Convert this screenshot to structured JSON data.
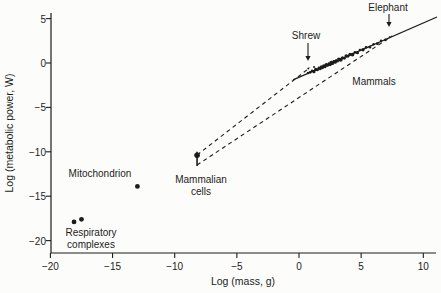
{
  "figure": {
    "background": "#fcfcfa",
    "ink_color": "#1c1c1c"
  },
  "chart_data": {
    "type": "scatter",
    "title": "",
    "xlabel": "Log (mass, g)",
    "ylabel": "Log (metabolic power, W)",
    "xlim": [
      -20,
      10
    ],
    "ylim": [
      -20,
      5
    ],
    "x_ticks": [
      -20,
      -15,
      -10,
      -5,
      0,
      5,
      10
    ],
    "y_ticks": [
      5,
      0,
      -5,
      -10,
      -15,
      -20
    ],
    "grid": false,
    "legend": "none",
    "series": [
      {
        "name": "Respiratory complexes",
        "marker_r": 2.4,
        "points": [
          [
            -18.1,
            -17.9
          ],
          [
            -17.5,
            -17.6
          ]
        ]
      },
      {
        "name": "Mitochondrion",
        "marker_r": 2.4,
        "points": [
          [
            -13.0,
            -13.9
          ]
        ]
      },
      {
        "name": "Mammalian cells",
        "marker_r": 2.8,
        "points": [
          [
            -8.2,
            -10.4
          ]
        ],
        "error_bar_y": [
          -11.6,
          -10.0
        ]
      },
      {
        "name": "Mammals",
        "marker_r": 1.5,
        "points_xyr": [
          [
            0.72,
            -1.13,
            1.2
          ],
          [
            0.75,
            -0.62,
            1.0
          ],
          [
            0.9,
            -1.05,
            1.4
          ],
          [
            1.05,
            -0.88,
            1.2
          ],
          [
            1.2,
            -0.98,
            1.6
          ],
          [
            1.21,
            -0.45,
            1.0
          ],
          [
            1.35,
            -0.73,
            1.8
          ],
          [
            1.5,
            -0.77,
            1.4
          ],
          [
            1.6,
            -0.52,
            1.2
          ],
          [
            1.7,
            -0.62,
            1.8
          ],
          [
            1.8,
            -0.44,
            1.6
          ],
          [
            1.9,
            -0.54,
            1.4
          ],
          [
            2.0,
            -0.35,
            1.8
          ],
          [
            2.1,
            -0.45,
            1.3
          ],
          [
            2.2,
            -0.2,
            1.9
          ],
          [
            2.3,
            -0.26,
            1.5
          ],
          [
            2.4,
            -0.05,
            1.2
          ],
          [
            2.5,
            -0.17,
            1.7
          ],
          [
            2.6,
            0.03,
            2.0
          ],
          [
            2.7,
            -0.06,
            1.5
          ],
          [
            2.8,
            0.18,
            1.4
          ],
          [
            2.9,
            0.12,
            1.9
          ],
          [
            3.0,
            0.28,
            1.5
          ],
          [
            3.1,
            0.2,
            1.3
          ],
          [
            3.2,
            0.44,
            1.7
          ],
          [
            3.35,
            0.37,
            2.0
          ],
          [
            3.5,
            0.58,
            1.6
          ],
          [
            3.65,
            0.53,
            1.4
          ],
          [
            3.8,
            0.78,
            1.8
          ],
          [
            3.95,
            0.75,
            1.3
          ],
          [
            4.1,
            0.98,
            1.6
          ],
          [
            4.3,
            0.95,
            1.9
          ],
          [
            4.5,
            1.2,
            1.4
          ],
          [
            4.7,
            1.16,
            1.6
          ],
          [
            4.9,
            1.46,
            1.3
          ],
          [
            5.15,
            1.49,
            1.7
          ],
          [
            5.4,
            1.76,
            1.4
          ],
          [
            5.7,
            1.79,
            1.5
          ],
          [
            6.0,
            2.11,
            1.3
          ],
          [
            6.3,
            2.18,
            1.4
          ],
          [
            6.6,
            2.5,
            1.2
          ],
          [
            6.95,
            2.6,
            1.3
          ],
          [
            7.3,
            2.9,
            1.1
          ]
        ]
      }
    ],
    "lines": [
      {
        "name": "mammal-fit-line",
        "style": "solid",
        "from": [
          -0.48,
          -1.91
        ],
        "to": [
          11.1,
          5.18
        ]
      },
      {
        "name": "cells-to-shrew-extrapolation",
        "style": "dashed",
        "from": [
          -8.2,
          -10.36
        ],
        "to": [
          0.88,
          -0.51
        ]
      },
      {
        "name": "cells-to-elephant-extrapolation",
        "style": "dashed",
        "from": [
          -8.2,
          -11.49
        ],
        "to": [
          7.48,
          3.04
        ]
      }
    ]
  },
  "annotations": {
    "elephant": {
      "label": "Elephant",
      "x": 388,
      "y": 8,
      "arrow": {
        "x": 389,
        "y1": 14,
        "y2": 27
      }
    },
    "shrew": {
      "label": "Shrew",
      "x": 306,
      "y": 36,
      "arrow": {
        "x": 308,
        "y1": 43,
        "y2": 61
      }
    },
    "mammals": {
      "label": "Mammals",
      "x": 374,
      "y": 82
    },
    "mammalian_cells": {
      "label": "Mammalian\ncells",
      "x": 201,
      "y": 186
    },
    "mitochondrion": {
      "label": "Mitochondrion",
      "x": 100,
      "y": 174
    },
    "respiratory_complexes": {
      "label": "Respiratory\ncomplexes",
      "x": 91,
      "y": 239
    }
  }
}
